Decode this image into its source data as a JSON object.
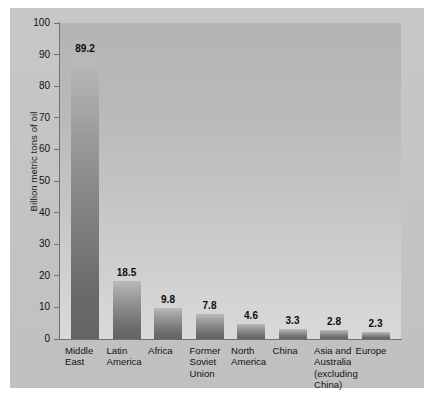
{
  "chart_data": {
    "type": "bar",
    "title": "",
    "xlabel": "",
    "ylabel": "Billion metric tons of oil",
    "ylim": [
      0,
      100
    ],
    "yticks": [
      "0",
      "10",
      "20",
      "30",
      "40",
      "50",
      "60",
      "70",
      "80",
      "90",
      "100"
    ],
    "grid": false,
    "legend": "none",
    "categories": [
      "Middle East",
      "Latin America",
      "Africa",
      "Former Soviet Union",
      "North America",
      "China",
      "Asia and Australia (excluding China)",
      "Europe"
    ],
    "category_lines": [
      [
        "Middle",
        "East"
      ],
      [
        "Latin",
        "America"
      ],
      [
        "Africa"
      ],
      [
        "Former",
        "Soviet",
        "Union"
      ],
      [
        "North",
        "America"
      ],
      [
        "China"
      ],
      [
        "Asia and",
        "Australia",
        "(excluding",
        "China)"
      ],
      [
        "Europe"
      ]
    ],
    "values": [
      89.2,
      18.5,
      9.8,
      7.8,
      4.6,
      3.3,
      2.8,
      2.3
    ],
    "value_labels": [
      "89.2",
      "18.5",
      "9.8",
      "7.8",
      "4.6",
      "3.3",
      "2.8",
      "2.3"
    ]
  },
  "colors": {
    "figure_background": "#c4c5c4",
    "plot_background_top": "#b3b4b3",
    "plot_background_bottom": "#d8d9d8",
    "bar_top": "#b9bab9",
    "bar_bottom": "#636463",
    "axis_line": "#6f706f",
    "text": "#111111",
    "page_background": "#ffffff"
  }
}
